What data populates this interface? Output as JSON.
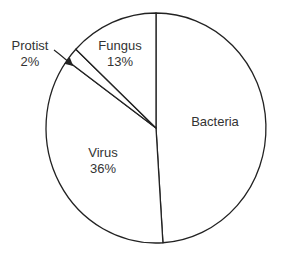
{
  "chart_data": {
    "type": "pie",
    "title": "",
    "categories": [
      "Bacteria",
      "Virus",
      "Protist",
      "Fungus"
    ],
    "values": [
      49,
      36,
      2,
      13
    ],
    "value_labels": [
      "",
      "36%",
      "2%",
      "13%"
    ],
    "start_angle_deg": 0,
    "direction": "clockwise",
    "legend": "none",
    "annotations": [
      {
        "text": "Protist 2%",
        "type": "arrow-callout",
        "target": "Protist"
      }
    ],
    "colors": {
      "fill": "#ffffff",
      "stroke": "#222222",
      "text": "#333333"
    }
  },
  "labels": {
    "bacteria": {
      "name": "Bacteria",
      "pct": ""
    },
    "virus": {
      "name": "Virus",
      "pct": "36%"
    },
    "protist": {
      "name": "Protist",
      "pct": "2%"
    },
    "fungus": {
      "name": "Fungus",
      "pct": "13%"
    }
  }
}
